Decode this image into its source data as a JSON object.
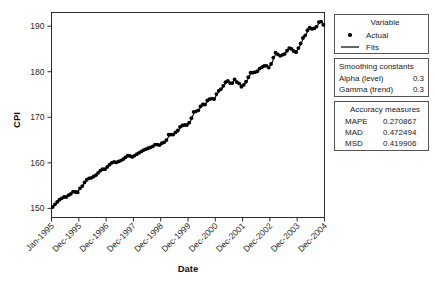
{
  "chart_data": {
    "type": "line",
    "title": "",
    "xlabel": "Date",
    "ylabel": "CPI",
    "ylim": [
      148,
      193
    ],
    "yticks": [
      150,
      160,
      170,
      180,
      190
    ],
    "grid": false,
    "xtick_labels": [
      "Jan-1995",
      "Dec-1995",
      "Dec-1996",
      "Dec-1997",
      "Dec-1998",
      "Dec-1999",
      "Dec-2000",
      "Dec-2001",
      "Dec-2002",
      "Dec-2003",
      "Dec-2004"
    ],
    "x_start_label": "Jan-1995",
    "x_end_label": "Dec-2004",
    "n_points": 120,
    "series": [
      {
        "name": "Actual",
        "marker": "dot",
        "values": [
          150.3,
          150.9,
          151.4,
          151.9,
          152.2,
          152.5,
          152.5,
          152.9,
          153.2,
          153.7,
          153.6,
          153.5,
          154.4,
          154.9,
          155.7,
          156.3,
          156.6,
          156.7,
          157.0,
          157.3,
          157.8,
          158.3,
          158.6,
          158.6,
          159.1,
          159.6,
          160.0,
          160.2,
          160.1,
          160.3,
          160.5,
          160.8,
          161.2,
          161.6,
          161.5,
          161.3,
          161.6,
          161.9,
          162.2,
          162.5,
          162.8,
          163.0,
          163.2,
          163.4,
          163.6,
          164.0,
          164.0,
          163.9,
          164.3,
          164.5,
          165.0,
          166.2,
          166.2,
          166.2,
          166.7,
          167.1,
          167.9,
          168.2,
          168.3,
          168.3,
          168.8,
          169.8,
          171.2,
          171.3,
          171.5,
          172.4,
          172.8,
          172.8,
          173.7,
          174.0,
          174.1,
          174.0,
          175.1,
          175.8,
          176.2,
          176.9,
          177.7,
          178.0,
          177.5,
          177.5,
          178.3,
          177.7,
          177.4,
          176.7,
          177.1,
          177.8,
          178.8,
          179.8,
          179.8,
          179.9,
          180.1,
          180.7,
          181.0,
          181.3,
          181.3,
          180.9,
          181.7,
          183.1,
          184.2,
          183.8,
          183.5,
          183.7,
          183.9,
          184.6,
          185.2,
          185.0,
          184.5,
          184.3,
          185.2,
          186.2,
          187.4,
          188.0,
          189.1,
          189.7,
          189.4,
          189.5,
          189.9,
          190.9,
          191.0,
          190.3
        ]
      },
      {
        "name": "Fits",
        "marker": "line",
        "values": [
          150.1,
          150.7,
          151.3,
          151.8,
          152.2,
          152.5,
          152.7,
          152.9,
          153.2,
          153.6,
          153.8,
          153.8,
          154.2,
          154.8,
          155.5,
          156.1,
          156.5,
          156.7,
          157.0,
          157.3,
          157.7,
          158.1,
          158.5,
          158.7,
          159.0,
          159.5,
          159.9,
          160.2,
          160.2,
          160.3,
          160.5,
          160.7,
          161.1,
          161.4,
          161.5,
          161.5,
          161.6,
          161.8,
          162.1,
          162.4,
          162.7,
          162.9,
          163.1,
          163.3,
          163.6,
          163.9,
          164.0,
          164.0,
          164.2,
          164.4,
          164.8,
          165.8,
          166.1,
          166.2,
          166.5,
          166.9,
          167.6,
          168.1,
          168.3,
          168.4,
          168.7,
          169.5,
          170.8,
          171.2,
          171.4,
          172.1,
          172.6,
          172.8,
          173.4,
          173.9,
          174.1,
          174.1,
          174.8,
          175.6,
          176.1,
          176.7,
          177.4,
          177.9,
          177.7,
          177.6,
          178.1,
          177.9,
          177.6,
          177.0,
          177.1,
          177.6,
          178.5,
          179.5,
          179.8,
          179.9,
          180.1,
          180.5,
          180.9,
          181.2,
          181.3,
          181.1,
          181.5,
          182.7,
          183.9,
          183.9,
          183.6,
          183.7,
          183.9,
          184.4,
          185.0,
          185.1,
          184.7,
          184.4,
          185.0,
          185.9,
          187.1,
          187.8,
          188.8,
          189.5,
          189.5,
          189.5,
          189.8,
          190.6,
          190.9,
          190.5
        ]
      }
    ]
  },
  "legend": {
    "title": "Variable",
    "items": [
      {
        "label": "Actual",
        "marker": "dot"
      },
      {
        "label": "Fits",
        "marker": "line"
      }
    ]
  },
  "smoothing": {
    "title": "Smoothing constants",
    "rows": [
      {
        "label": "Alpha (level)",
        "value": "0.3"
      },
      {
        "label": "Gamma (trend)",
        "value": "0.3"
      }
    ]
  },
  "accuracy": {
    "title": "Accuracy measures",
    "rows": [
      {
        "label": "MAPE",
        "value": "0.270867"
      },
      {
        "label": "MAD",
        "value": "0.472494"
      },
      {
        "label": "MSD",
        "value": "0.419906"
      }
    ]
  },
  "colors": {
    "series": "#000000",
    "axis": "#2b2b2b",
    "panel_border": "#555555",
    "background": "#ffffff"
  }
}
